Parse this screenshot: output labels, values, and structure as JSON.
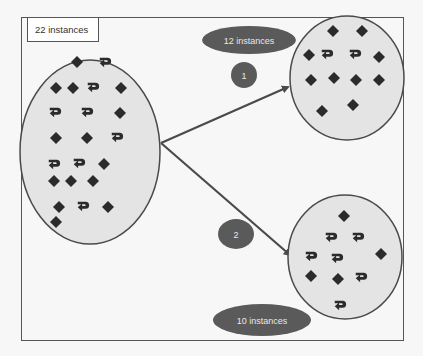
{
  "colors": {
    "background": "#f7f7f7",
    "frame": "#555555",
    "cluster_fill": "#e4e4e4",
    "cluster_stroke": "#4a4a4a",
    "shape": "#2b2b2b",
    "badge_fill": "#5a5a5a",
    "badge_text": "#e8e8e8",
    "arrow": "#4a4a4a"
  },
  "source": {
    "label": "22 instances",
    "ellipse": {
      "cx": 90,
      "cy": 152,
      "rx": 70,
      "ry": 92
    },
    "shapes": [
      {
        "type": "diamond",
        "x": 77,
        "y": 62
      },
      {
        "type": "hook",
        "x": 105,
        "y": 62
      },
      {
        "type": "diamond",
        "x": 56,
        "y": 88
      },
      {
        "type": "diamond",
        "x": 73,
        "y": 88
      },
      {
        "type": "hook",
        "x": 93,
        "y": 87
      },
      {
        "type": "diamond",
        "x": 121,
        "y": 88
      },
      {
        "type": "hook",
        "x": 55,
        "y": 112
      },
      {
        "type": "hook",
        "x": 87,
        "y": 112
      },
      {
        "type": "diamond",
        "x": 120,
        "y": 113
      },
      {
        "type": "diamond",
        "x": 56,
        "y": 138
      },
      {
        "type": "diamond",
        "x": 87,
        "y": 138
      },
      {
        "type": "hook",
        "x": 117,
        "y": 137
      },
      {
        "type": "hook",
        "x": 54,
        "y": 164
      },
      {
        "type": "hook",
        "x": 79,
        "y": 163
      },
      {
        "type": "diamond",
        "x": 104,
        "y": 164
      },
      {
        "type": "diamond",
        "x": 54,
        "y": 181
      },
      {
        "type": "diamond",
        "x": 71,
        "y": 181
      },
      {
        "type": "diamond",
        "x": 93,
        "y": 181
      },
      {
        "type": "diamond",
        "x": 59,
        "y": 207
      },
      {
        "type": "hook",
        "x": 83,
        "y": 206
      },
      {
        "type": "diamond",
        "x": 108,
        "y": 207
      },
      {
        "type": "diamond",
        "x": 56,
        "y": 222
      }
    ]
  },
  "clusters": [
    {
      "id": "1",
      "badge": "1",
      "label": "12 instances",
      "ellipse": {
        "cx": 347,
        "cy": 78,
        "rx": 57,
        "ry": 62
      },
      "shapes": [
        {
          "type": "diamond",
          "x": 333,
          "y": 31
        },
        {
          "type": "diamond",
          "x": 362,
          "y": 31
        },
        {
          "type": "diamond",
          "x": 309,
          "y": 55
        },
        {
          "type": "hook",
          "x": 327,
          "y": 54
        },
        {
          "type": "hook",
          "x": 355,
          "y": 54
        },
        {
          "type": "diamond",
          "x": 379,
          "y": 57
        },
        {
          "type": "diamond",
          "x": 311,
          "y": 80
        },
        {
          "type": "diamond",
          "x": 334,
          "y": 78
        },
        {
          "type": "diamond",
          "x": 356,
          "y": 80
        },
        {
          "type": "diamond",
          "x": 379,
          "y": 80
        },
        {
          "type": "diamond",
          "x": 322,
          "y": 111
        },
        {
          "type": "diamond",
          "x": 353,
          "y": 105
        }
      ]
    },
    {
      "id": "2",
      "badge": "2",
      "label": "10 instances",
      "ellipse": {
        "cx": 345,
        "cy": 257,
        "rx": 57,
        "ry": 62
      },
      "shapes": [
        {
          "type": "diamond",
          "x": 344,
          "y": 216
        },
        {
          "type": "hook",
          "x": 331,
          "y": 237
        },
        {
          "type": "hook",
          "x": 358,
          "y": 237
        },
        {
          "type": "hook",
          "x": 311,
          "y": 256
        },
        {
          "type": "hook",
          "x": 337,
          "y": 258
        },
        {
          "type": "diamond",
          "x": 381,
          "y": 254
        },
        {
          "type": "diamond",
          "x": 311,
          "y": 276
        },
        {
          "type": "diamond",
          "x": 338,
          "y": 279
        },
        {
          "type": "hook",
          "x": 361,
          "y": 277
        },
        {
          "type": "hook",
          "x": 340,
          "y": 305
        }
      ]
    }
  ],
  "arrows": [
    {
      "to": "1",
      "from": [
        161,
        143
      ],
      "end": [
        288,
        87
      ]
    },
    {
      "to": "2",
      "from": [
        161,
        143
      ],
      "end": [
        290,
        255
      ]
    }
  ]
}
